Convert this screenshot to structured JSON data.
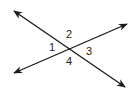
{
  "diagram": {
    "line_color": "#1a1a1a",
    "text_color": "#222222",
    "intersection": {
      "x": 70,
      "y": 48
    },
    "lines": [
      {
        "name": "line-a",
        "from": {
          "x": 14,
          "y": 11
        },
        "to": {
          "x": 125,
          "y": 87
        },
        "arrows": "both"
      },
      {
        "name": "line-b",
        "from": {
          "x": 14,
          "y": 73
        },
        "to": {
          "x": 127,
          "y": 24
        },
        "arrows": "both"
      }
    ],
    "angle_labels": [
      {
        "text": "1",
        "x": 52,
        "y": 47
      },
      {
        "text": "2",
        "x": 69,
        "y": 34
      },
      {
        "text": "3",
        "x": 89,
        "y": 51
      },
      {
        "text": "4",
        "x": 69,
        "y": 61
      }
    ]
  }
}
